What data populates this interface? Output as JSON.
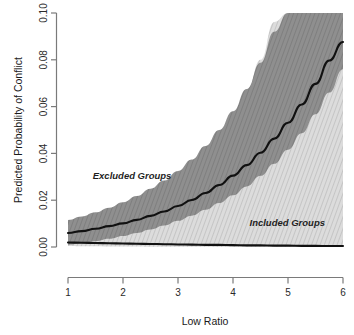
{
  "chart_data": {
    "type": "line",
    "title": "",
    "xlabel": "Low Ratio",
    "ylabel": "Predicted Probability of Conflict",
    "xlim": [
      1,
      6
    ],
    "ylim": [
      0.0,
      0.1
    ],
    "xticks": [
      1,
      2,
      3,
      4,
      5,
      6
    ],
    "xtick_labels": [
      "1",
      "2",
      "3",
      "4",
      "5",
      "6"
    ],
    "yticks": [
      0.0,
      0.02,
      0.04,
      0.06,
      0.08,
      0.1
    ],
    "ytick_labels": [
      "0.00",
      "0.02",
      "0.04",
      "0.06",
      "0.08",
      "0.10"
    ],
    "grid": false,
    "legend_position": "inline-annotations",
    "x": [
      1.0,
      1.25,
      1.5,
      1.75,
      2.0,
      2.25,
      2.5,
      2.75,
      3.0,
      3.25,
      3.5,
      3.75,
      4.0,
      4.25,
      4.5,
      4.75,
      5.0,
      5.25,
      5.5,
      5.75,
      6.0
    ],
    "series": [
      {
        "name": "Excluded Groups",
        "kind": "mean-line",
        "color": "#111111",
        "values": [
          0.006,
          0.0068,
          0.0078,
          0.0089,
          0.0101,
          0.0116,
          0.0133,
          0.0152,
          0.0175,
          0.0201,
          0.0231,
          0.0265,
          0.0305,
          0.035,
          0.0403,
          0.0463,
          0.0531,
          0.0609,
          0.0697,
          0.0797,
          0.0876
        ]
      },
      {
        "name": "Excluded Groups CI",
        "kind": "band",
        "color": "#8a8a8a",
        "upper": [
          0.0115,
          0.013,
          0.0148,
          0.0168,
          0.0191,
          0.0218,
          0.0249,
          0.0284,
          0.0325,
          0.0374,
          0.0432,
          0.05,
          0.058,
          0.0675,
          0.0787,
          0.092,
          0.1,
          0.1,
          0.1,
          0.1,
          0.1
        ],
        "lower": [
          0.001,
          0.0016,
          0.0025,
          0.0035,
          0.0047,
          0.006,
          0.0075,
          0.0092,
          0.0112,
          0.0134,
          0.0159,
          0.0188,
          0.0221,
          0.0259,
          0.0304,
          0.0356,
          0.0416,
          0.0486,
          0.0567,
          0.066,
          0.076
        ]
      },
      {
        "name": "Included Groups",
        "kind": "mean-line",
        "color": "#111111",
        "values": [
          0.0019,
          0.0018,
          0.0017,
          0.0016,
          0.0015,
          0.0014,
          0.0013,
          0.0012,
          0.0011,
          0.001,
          0.0009,
          0.0009,
          0.0008,
          0.0007,
          0.0007,
          0.0006,
          0.0006,
          0.0005,
          0.0005,
          0.0004,
          0.0004
        ]
      },
      {
        "name": "Included Groups CI",
        "kind": "band",
        "color": "#cdcdcd",
        "upper": [
          0.0038,
          0.0048,
          0.0062,
          0.0079,
          0.01,
          0.0126,
          0.0157,
          0.0196,
          0.0243,
          0.0299,
          0.0367,
          0.0448,
          0.0546,
          0.0662,
          0.08,
          0.0962,
          0.1,
          0.1,
          0.1,
          0.1,
          0.1
        ],
        "lower": [
          0.0004,
          0.0003,
          0.0003,
          0.0002,
          0.0002,
          0.0002,
          0.0001,
          0.0001,
          0.0001,
          0.0001,
          0.0001,
          0.0,
          0.0,
          0.0,
          0.0,
          0.0,
          0.0,
          0.0,
          0.0,
          0.0,
          0.0
        ]
      }
    ],
    "annotations": [
      {
        "text": "Excluded Groups",
        "x": 1.45,
        "y": 0.0292
      },
      {
        "text": "Included Groups",
        "x": 4.3,
        "y": 0.009
      }
    ]
  },
  "axes": {
    "x_title": "Low Ratio",
    "y_title": "Predicted Probability of Conflict",
    "x_labels": [
      "1",
      "2",
      "3",
      "4",
      "5",
      "6"
    ],
    "y_labels": [
      "0.00",
      "0.02",
      "0.04",
      "0.06",
      "0.08",
      "0.10"
    ]
  },
  "annotations": {
    "excluded": "Excluded Groups",
    "included": "Included Groups"
  },
  "colors": {
    "background": "#ffffff",
    "axis": "#7a7a7a",
    "curve": "#111111",
    "band_dark": "#8a8a8a",
    "band_light": "#cdcdcd",
    "text": "#1a1a1a"
  }
}
